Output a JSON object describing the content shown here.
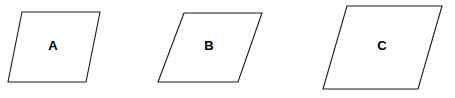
{
  "figure": {
    "type": "geometry-figure",
    "canvas": {
      "width": 455,
      "height": 98
    },
    "background_color": "#ffffff",
    "stroke_color": "#1a1a1a",
    "fill_color": "#ffffff",
    "label_color": "#000000",
    "shapes": [
      {
        "id": "shape-a",
        "label": "A",
        "kind": "parallelogram",
        "points": "22,12 100,12 86,82 8,82",
        "label_x": 53,
        "label_y": 47,
        "base": 78,
        "height": 70,
        "skew": 14
      },
      {
        "id": "shape-b",
        "label": "B",
        "kind": "parallelogram",
        "points": "184,13 262,13 238,82 158,82",
        "label_x": 209,
        "label_y": 47,
        "base": 78,
        "height": 69,
        "skew": 25
      },
      {
        "id": "shape-c",
        "label": "C",
        "kind": "parallelogram",
        "points": "347,6 442,6 418,89 323,89",
        "label_x": 382,
        "label_y": 47,
        "base": 95,
        "height": 83,
        "skew": 24
      }
    ]
  }
}
